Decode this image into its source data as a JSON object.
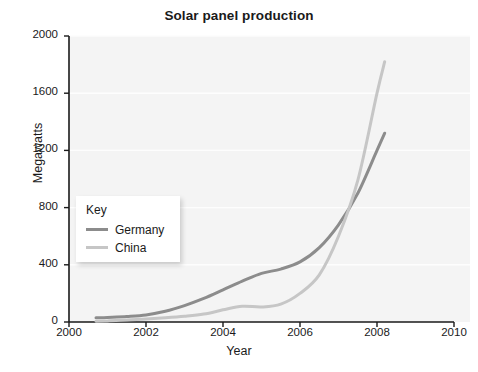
{
  "chart_data": {
    "type": "line",
    "title": "Solar panel production",
    "xlabel": "Year",
    "ylabel": "Megawatts",
    "xlim": [
      2000,
      2010
    ],
    "ylim": [
      0,
      2000
    ],
    "xticks": [
      "2000",
      "2002",
      "2004",
      "2006",
      "2008",
      "2010"
    ],
    "yticks": [
      "0",
      "400",
      "800",
      "1200",
      "1600",
      "2000"
    ],
    "grid": true,
    "legend_position": "inside-left",
    "legend_title": "Key",
    "series": [
      {
        "name": "Germany",
        "color": "#8c8c8c",
        "x": [
          2000.7,
          2001.0,
          2001.5,
          2002.0,
          2002.5,
          2003.0,
          2003.5,
          2004.0,
          2004.5,
          2005.0,
          2005.5,
          2006.0,
          2006.5,
          2007.0,
          2007.5,
          2008.0,
          2008.2
        ],
        "values": [
          30,
          32,
          38,
          50,
          75,
          115,
          165,
          225,
          285,
          340,
          370,
          420,
          520,
          680,
          900,
          1200,
          1320
        ]
      },
      {
        "name": "China",
        "color": "#c6c6c6",
        "x": [
          2000.7,
          2001.0,
          2001.5,
          2002.0,
          2002.5,
          2003.0,
          2003.5,
          2004.0,
          2004.5,
          2005.0,
          2005.5,
          2006.0,
          2006.5,
          2007.0,
          2007.5,
          2008.0,
          2008.2
        ],
        "values": [
          5,
          8,
          14,
          22,
          30,
          40,
          55,
          85,
          110,
          105,
          125,
          200,
          330,
          600,
          990,
          1600,
          1820
        ]
      }
    ]
  },
  "axes": {
    "x_pixels": {
      "x0": 69,
      "x1": 454,
      "v0": 2000,
      "v1": 2010
    },
    "y_pixels": {
      "y0": 322,
      "y1": 36,
      "v0": 0,
      "v1": 2000
    }
  },
  "colors": {
    "plot_background": "#f4f4f4",
    "axis": "#1a1a1a",
    "gridline": "#fdfdfd",
    "germany": "#8c8c8c",
    "china": "#c6c6c6"
  }
}
